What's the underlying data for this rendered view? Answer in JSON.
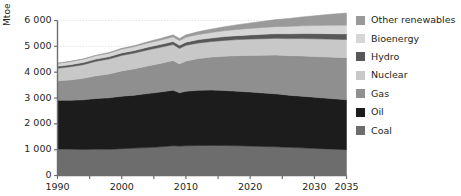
{
  "chart_data": {
    "type": "area",
    "stacked": true,
    "title": "",
    "xlabel": "",
    "ylabel": "Mtoe",
    "xlim": [
      1990,
      2035
    ],
    "ylim": [
      0,
      6000
    ],
    "grid": true,
    "grid_axis": "y",
    "legend_position": "right",
    "ytick_labels": [
      "0",
      "1 000",
      "2 000",
      "3 000",
      "4 000",
      "5 000",
      "6 000"
    ],
    "ytick_values": [
      0,
      1000,
      2000,
      3000,
      4000,
      5000,
      6000
    ],
    "xtick_labels": [
      "1990",
      "2000",
      "2010",
      "2020",
      "2030",
      "2035"
    ],
    "xtick_values": [
      1990,
      2000,
      2010,
      2020,
      2030,
      2035
    ],
    "x": [
      1990,
      1992,
      1994,
      1996,
      1998,
      2000,
      2002,
      2004,
      2006,
      2008,
      2009,
      2010,
      2012,
      2014,
      2016,
      2018,
      2020,
      2022,
      2024,
      2026,
      2028,
      2030,
      2032,
      2035
    ],
    "series": [
      {
        "name": "Coal",
        "color": "#6d6d6d",
        "values": [
          1030,
          1020,
          1010,
          1020,
          1015,
          1040,
          1060,
          1080,
          1110,
          1150,
          1140,
          1150,
          1160,
          1165,
          1160,
          1150,
          1140,
          1125,
          1110,
          1090,
          1070,
          1050,
          1030,
          1000
        ]
      },
      {
        "name": "Oil",
        "color": "#1c1c1c",
        "values": [
          1880,
          1890,
          1920,
          1960,
          1990,
          2030,
          2050,
          2090,
          2120,
          2150,
          2060,
          2110,
          2140,
          2140,
          2130,
          2110,
          2090,
          2070,
          2050,
          2020,
          2000,
          1980,
          1960,
          1930
        ]
      },
      {
        "name": "Gas",
        "color": "#8f8f8f",
        "values": [
          760,
          790,
          830,
          880,
          920,
          980,
          1020,
          1070,
          1110,
          1150,
          1120,
          1170,
          1230,
          1280,
          1330,
          1380,
          1420,
          1460,
          1500,
          1530,
          1560,
          1580,
          1600,
          1630
        ]
      },
      {
        "name": "Nuclear",
        "color": "#c8c8c8",
        "values": [
          480,
          510,
          530,
          560,
          580,
          600,
          610,
          620,
          620,
          620,
          600,
          610,
          600,
          600,
          610,
          620,
          630,
          640,
          650,
          660,
          670,
          680,
          690,
          700
        ]
      },
      {
        "name": "Hydro",
        "color": "#585858",
        "values": [
          75,
          78,
          82,
          86,
          90,
          94,
          98,
          104,
          110,
          116,
          118,
          122,
          130,
          138,
          146,
          154,
          162,
          170,
          178,
          186,
          194,
          202,
          210,
          220
        ]
      },
      {
        "name": "Bioenergy",
        "color": "#d6d6d6",
        "values": [
          115,
          120,
          126,
          132,
          138,
          145,
          152,
          160,
          170,
          180,
          182,
          190,
          202,
          214,
          226,
          238,
          250,
          262,
          274,
          286,
          298,
          310,
          322,
          340
        ]
      },
      {
        "name": "Other renewables",
        "color": "#9a9a9a",
        "values": [
          12,
          14,
          17,
          21,
          26,
          32,
          40,
          50,
          62,
          78,
          84,
          92,
          112,
          134,
          158,
          184,
          212,
          242,
          274,
          308,
          344,
          382,
          420,
          470
        ]
      }
    ],
    "legend_entries": [
      {
        "label": "Other renewables",
        "color": "#9a9a9a"
      },
      {
        "label": "Bioenergy",
        "color": "#d6d6d6"
      },
      {
        "label": "Hydro",
        "color": "#585858"
      },
      {
        "label": "Nuclear",
        "color": "#c8c8c8"
      },
      {
        "label": "Gas",
        "color": "#8f8f8f"
      },
      {
        "label": "Oil",
        "color": "#1c1c1c"
      },
      {
        "label": "Coal",
        "color": "#6d6d6d"
      }
    ],
    "axis_color": "#6e6e6e",
    "grid_color": "#e2e2e2",
    "text_color": "#231f20"
  }
}
